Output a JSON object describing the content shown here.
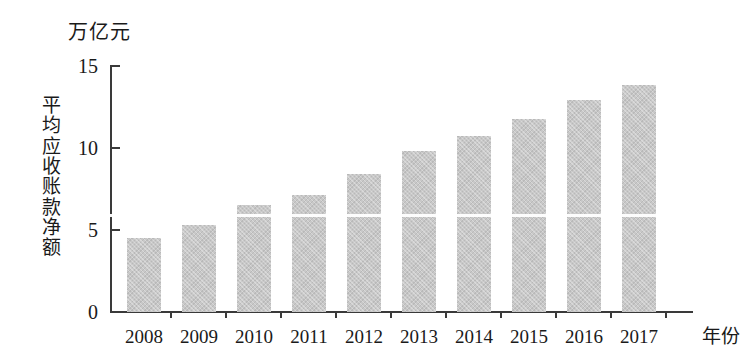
{
  "chart_data": {
    "type": "bar",
    "title": "",
    "subtitle": "",
    "xlabel": "年份",
    "ylabel": "平均应收账款净额",
    "unit_label": "万亿元",
    "categories": [
      "2008",
      "2009",
      "2010",
      "2011",
      "2012",
      "2013",
      "2014",
      "2015",
      "2016",
      "2017"
    ],
    "values": [
      4.5,
      5.3,
      6.5,
      7.1,
      8.4,
      9.8,
      10.7,
      11.7,
      12.9,
      13.8
    ],
    "series": [
      {
        "name": "平均应收账款净额",
        "values": [
          4.5,
          5.3,
          6.5,
          7.1,
          8.4,
          9.8,
          10.7,
          11.7,
          12.9,
          13.8
        ]
      }
    ],
    "ylim": [
      0,
      15
    ],
    "yticks": [
      0,
      5,
      10,
      15
    ],
    "ytick_labels": [
      "0",
      "5",
      "10",
      "15"
    ],
    "grid": false,
    "legend": false,
    "legend_position": "none",
    "bar_color": "#c8c8c8",
    "axis_color": "#3a3a3a"
  },
  "axis": {
    "unit_label": "万亿元",
    "y_title": "平均应收账款净额",
    "x_title": "年份",
    "y_tick_labels": [
      "15",
      "10",
      "5",
      "0"
    ]
  }
}
